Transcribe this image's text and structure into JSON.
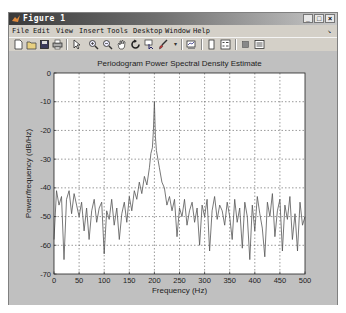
{
  "window": {
    "title": "Figure 1",
    "controls": {
      "minimize": "_",
      "maximize": "□",
      "close": "×"
    }
  },
  "menubar": {
    "items": [
      {
        "label": "File"
      },
      {
        "label": "Edit"
      },
      {
        "label": "View"
      },
      {
        "label": "Insert"
      },
      {
        "label": "Tools"
      },
      {
        "label": "Desktop"
      },
      {
        "label": "Window"
      },
      {
        "label": "Help"
      }
    ],
    "dock_arrow": "↘"
  },
  "toolbar": {
    "buttons": [
      {
        "name": "new-figure",
        "icon": "new-file-icon"
      },
      {
        "name": "open-file",
        "icon": "open-folder-icon"
      },
      {
        "name": "save-figure",
        "icon": "save-disk-icon"
      },
      {
        "name": "print-figure",
        "icon": "printer-icon"
      },
      {
        "name": "edit-plot",
        "icon": "arrow-pointer-icon"
      },
      {
        "name": "zoom-in",
        "icon": "zoom-in-icon"
      },
      {
        "name": "zoom-out",
        "icon": "zoom-out-icon"
      },
      {
        "name": "pan",
        "icon": "hand-icon"
      },
      {
        "name": "rotate-3d",
        "icon": "rotate-icon"
      },
      {
        "name": "data-cursor",
        "icon": "data-cursor-icon"
      },
      {
        "name": "brush",
        "icon": "brush-icon"
      },
      {
        "name": "link-plot",
        "icon": "link-plot-icon"
      },
      {
        "name": "insert-colorbar",
        "icon": "colorbar-icon"
      },
      {
        "name": "insert-legend",
        "icon": "legend-icon"
      },
      {
        "name": "hide-plot-tools",
        "icon": "hide-tools-icon"
      },
      {
        "name": "show-plot-tools",
        "icon": "show-tools-icon"
      }
    ]
  },
  "colors": {
    "figure_bg": "#c0c0c0",
    "axes_bg": "#ffffff",
    "line": "#555555",
    "grid": "#555555",
    "text": "#222222"
  },
  "chart_data": {
    "type": "line",
    "title": "Periodogram Power Spectral Density Estimate",
    "xlabel": "Frequency (Hz)",
    "ylabel": "Power/frequency (dB/Hz)",
    "xlim": [
      0,
      500
    ],
    "ylim": [
      -70,
      0
    ],
    "xticks": [
      0,
      50,
      100,
      150,
      200,
      250,
      300,
      350,
      400,
      450,
      500
    ],
    "yticks": [
      0,
      -10,
      -20,
      -30,
      -40,
      -50,
      -60,
      -70
    ],
    "grid": true,
    "legend": null,
    "annotations": [],
    "series": [
      {
        "name": "PSD",
        "x": [
          0,
          5,
          10,
          15,
          20,
          25,
          30,
          35,
          40,
          45,
          50,
          55,
          60,
          65,
          70,
          75,
          80,
          85,
          90,
          95,
          100,
          105,
          110,
          115,
          120,
          125,
          130,
          135,
          140,
          145,
          150,
          155,
          160,
          165,
          170,
          175,
          180,
          185,
          190,
          193,
          196,
          198,
          200,
          202,
          204,
          207,
          210,
          215,
          220,
          225,
          230,
          235,
          240,
          245,
          250,
          255,
          260,
          265,
          270,
          275,
          280,
          285,
          290,
          295,
          300,
          305,
          310,
          315,
          320,
          325,
          330,
          335,
          340,
          345,
          350,
          355,
          360,
          365,
          370,
          375,
          380,
          385,
          390,
          395,
          400,
          405,
          410,
          415,
          420,
          425,
          430,
          435,
          440,
          445,
          450,
          455,
          460,
          465,
          470,
          475,
          480,
          485,
          490,
          495,
          500
        ],
        "values": [
          -58,
          -41,
          -46,
          -43,
          -65,
          -44,
          -41,
          -49,
          -42,
          -46,
          -50,
          -45,
          -55,
          -47,
          -58,
          -48,
          -44,
          -52,
          -47,
          -45,
          -63,
          -48,
          -51,
          -44,
          -53,
          -47,
          -58,
          -49,
          -45,
          -52,
          -43,
          -48,
          -41,
          -44,
          -38,
          -42,
          -36,
          -39,
          -33,
          -28,
          -26,
          -20,
          -10,
          -22,
          -27,
          -30,
          -33,
          -38,
          -40,
          -46,
          -43,
          -48,
          -44,
          -57,
          -47,
          -50,
          -44,
          -53,
          -48,
          -45,
          -52,
          -47,
          -60,
          -46,
          -50,
          -44,
          -62,
          -48,
          -43,
          -51,
          -46,
          -48,
          -53,
          -45,
          -50,
          -58,
          -44,
          -52,
          -47,
          -61,
          -45,
          -50,
          -65,
          -46,
          -55,
          -43,
          -49,
          -54,
          -64,
          -45,
          -50,
          -42,
          -57,
          -48,
          -44,
          -62,
          -46,
          -51,
          -43,
          -58,
          -49,
          -62,
          -45,
          -53,
          -50
        ]
      }
    ]
  }
}
